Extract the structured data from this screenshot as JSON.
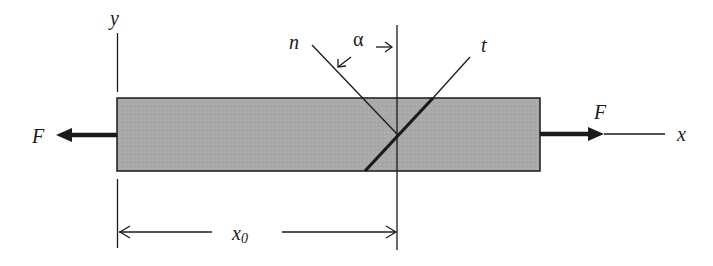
{
  "diagram": {
    "type": "bar under axial tension with inclined section",
    "colors": {
      "bar_fill": "#a9a9a9",
      "stroke": "#1a1a1a",
      "background": "#ffffff"
    },
    "labels": {
      "y_axis": "y",
      "x_axis": "x",
      "force_left": "F",
      "force_right": "F",
      "normal": "n",
      "tangent": "t",
      "angle": "α",
      "distance": "x",
      "distance_subscript": "0"
    },
    "elements": [
      {
        "id": "bar",
        "kind": "rectangle",
        "description": "Shaded prismatic bar"
      },
      {
        "id": "force-left",
        "kind": "arrow",
        "direction": "left",
        "label": "F"
      },
      {
        "id": "force-right",
        "kind": "arrow",
        "direction": "right",
        "label": "F"
      },
      {
        "id": "x-axis",
        "kind": "line",
        "label": "x"
      },
      {
        "id": "y-axis",
        "kind": "line",
        "label": "y"
      },
      {
        "id": "section-plane",
        "kind": "line",
        "description": "Vertical reference line at x0"
      },
      {
        "id": "inclined-section",
        "kind": "line",
        "label": "t",
        "description": "Inclined cut plane, tangent direction"
      },
      {
        "id": "normal-line",
        "kind": "line",
        "label": "n",
        "description": "Normal to inclined section"
      },
      {
        "id": "angle-alpha",
        "kind": "angle-marker",
        "label": "α"
      },
      {
        "id": "dimension-x0",
        "kind": "dimension",
        "label": "x0"
      }
    ]
  }
}
